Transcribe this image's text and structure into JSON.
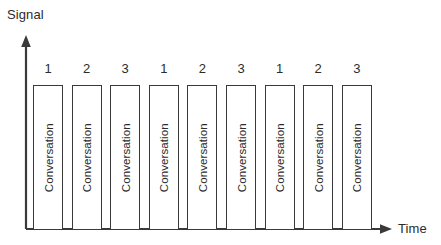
{
  "figure": {
    "background_color": "#ffffff",
    "stroke_color": "#3a3a3a",
    "text_color": "#2b2b2b"
  },
  "axes": {
    "y_axis": {
      "label": "Signal",
      "arrow": "arrow-up-icon"
    },
    "x_axis": {
      "label": "Time",
      "arrow": "arrow-right-icon"
    }
  },
  "chart_data": {
    "type": "bar",
    "title": "",
    "xlabel": "Time",
    "ylabel": "Signal",
    "grid": false,
    "legend": null,
    "bar_label": "Conversation",
    "categories": [
      "1",
      "2",
      "3",
      "1",
      "2",
      "3",
      "1",
      "2",
      "3"
    ],
    "values": [
      1,
      1,
      1,
      1,
      1,
      1,
      1,
      1,
      1
    ],
    "ylim": [
      0,
      1.18
    ],
    "annotations": [
      "1",
      "2",
      "3",
      "1",
      "2",
      "3",
      "1",
      "2",
      "3"
    ],
    "bars": [
      {
        "number": "1",
        "label": "Conversation"
      },
      {
        "number": "2",
        "label": "Conversation"
      },
      {
        "number": "3",
        "label": "Conversation"
      },
      {
        "number": "1",
        "label": "Conversation"
      },
      {
        "number": "2",
        "label": "Conversation"
      },
      {
        "number": "3",
        "label": "Conversation"
      },
      {
        "number": "1",
        "label": "Conversation"
      },
      {
        "number": "2",
        "label": "Conversation"
      },
      {
        "number": "3",
        "label": "Conversation"
      }
    ]
  }
}
